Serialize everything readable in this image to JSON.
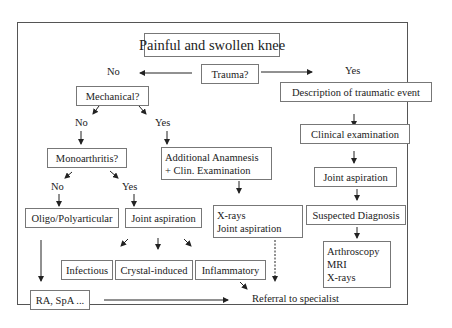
{
  "title": "Painful and swollen knee",
  "nodes": {
    "trauma": "Trauma?",
    "mechanical": "Mechanical?",
    "description": "Description of traumatic event",
    "clinical_exam": "Clinical examination",
    "joint_aspiration_right": "Joint aspiration",
    "suspected_diagnosis": "Suspected Diagnosis",
    "imaging": [
      "Arthroscopy",
      "MRI",
      "X-rays"
    ],
    "monoarthritis": "Monoarthritis?",
    "additional_anamnesis": [
      "Additional Anamnesis",
      "+ Clin. Examination"
    ],
    "oligo": "Oligo/Polyarticular",
    "joint_aspiration_mid": "Joint aspiration",
    "xrays_aspiration": [
      "X-rays",
      "Joint aspiration"
    ],
    "infectious": "Infectious",
    "crystal": "Crystal-induced",
    "inflammatory": "Inflammatory",
    "ra_spa": "RA, SpA ...",
    "referral": "Referral to specialist"
  },
  "labels": {
    "trauma_no": "No",
    "trauma_yes": "Yes",
    "mech_no": "No",
    "mech_yes": "Yes",
    "mono_no": "No",
    "mono_yes": "Yes"
  },
  "colors": {
    "line": "#222222",
    "box_border": "#777777",
    "frame": "#555555"
  }
}
